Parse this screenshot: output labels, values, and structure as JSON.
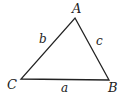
{
  "diagram": {
    "type": "triangle",
    "vertices": [
      {
        "label": "A",
        "x": 75,
        "y": 18
      },
      {
        "label": "B",
        "x": 109,
        "y": 80
      },
      {
        "label": "C",
        "x": 21,
        "y": 79
      }
    ],
    "sides": [
      {
        "label": "a",
        "between": "B-C"
      },
      {
        "label": "b",
        "between": "A-C"
      },
      {
        "label": "c",
        "between": "A-B"
      }
    ],
    "stroke_color": "#222222"
  }
}
